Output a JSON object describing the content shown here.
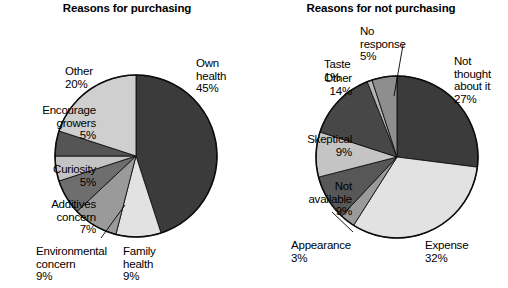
{
  "chart_data": [
    {
      "type": "pie",
      "title": "Reasons for purchasing",
      "categories": [
        "Own health",
        "Family health",
        "Environmental concern",
        "Additives concern",
        "Curiosity",
        "Encourage growers",
        "Other"
      ],
      "values": [
        45,
        9,
        9,
        7,
        5,
        5,
        20
      ],
      "unit": "%",
      "colors": [
        "#3b3b3b",
        "#e2e2e2",
        "#9a9a9a",
        "#6e6e6e",
        "#c4c4c4",
        "#555555",
        "#cfcfcf"
      ],
      "legend": "labels-outside",
      "start_angle_deg": 0,
      "direction": "clockwise"
    },
    {
      "type": "pie",
      "title": "Reasons for not purchasing",
      "categories": [
        "Not thought about it",
        "Expense",
        "Appearance",
        "Not available",
        "Skeptical",
        "Other",
        "Taste",
        "No response"
      ],
      "values": [
        27,
        32,
        3,
        9,
        9,
        14,
        1,
        5
      ],
      "unit": "%",
      "colors": [
        "#3b3b3b",
        "#e2e2e2",
        "#9a9a9a",
        "#575757",
        "#c4c4c4",
        "#474747",
        "#b5b5b5",
        "#8e8e8e"
      ],
      "legend": "labels-outside",
      "start_angle_deg": 0,
      "direction": "clockwise"
    }
  ],
  "left_chart": {
    "title": "Reasons for purchasing",
    "labels": [
      {
        "name": "own-health",
        "text": "Own\nhealth\n45%",
        "x": 196,
        "y": 57,
        "align": "left"
      },
      {
        "name": "family-health",
        "text": "Family\nhealth\n9%",
        "x": 123,
        "y": 245,
        "align": "left"
      },
      {
        "name": "environmental-concern",
        "text": "Environmental\nconcern\n9%",
        "x": 36,
        "y": 245,
        "align": "left"
      },
      {
        "name": "additives-concern",
        "text": "Additives\nconcern\n7%",
        "x": 1,
        "y": 198,
        "align": "right"
      },
      {
        "name": "curiosity",
        "text": "Curiosity\n5%",
        "x": 1,
        "y": 163,
        "align": "right"
      },
      {
        "name": "encourage-growers",
        "text": "Encourage\ngrowers\n5%",
        "x": 1,
        "y": 104,
        "align": "right"
      },
      {
        "name": "other",
        "text": "Other\n20%",
        "x": 65,
        "y": 65,
        "align": "left"
      }
    ]
  },
  "right_chart": {
    "title": "Reasons for not purchasing",
    "labels": [
      {
        "name": "not-thought-about-it",
        "text": "Not\nthought\nabout it\n27%",
        "x": 200,
        "y": 55,
        "align": "left"
      },
      {
        "name": "expense",
        "text": "Expense\n32%",
        "x": 171,
        "y": 239,
        "align": "left"
      },
      {
        "name": "appearance",
        "text": "Appearance\n3%",
        "x": 37,
        "y": 239,
        "align": "left"
      },
      {
        "name": "not-available",
        "text": "Not\navailable\n9%",
        "x": 3,
        "y": 180,
        "align": "right"
      },
      {
        "name": "skeptical",
        "text": "Skeptical\n9%",
        "x": 3,
        "y": 133,
        "align": "right"
      },
      {
        "name": "other",
        "text": "Other\n14%",
        "x": 3,
        "y": 72,
        "align": "right"
      },
      {
        "name": "taste",
        "text": "Taste\n1%",
        "x": 70,
        "y": 58,
        "align": "left"
      },
      {
        "name": "no-response",
        "text": "No\nresponse\n5%",
        "x": 106,
        "y": 25,
        "align": "left"
      }
    ]
  }
}
